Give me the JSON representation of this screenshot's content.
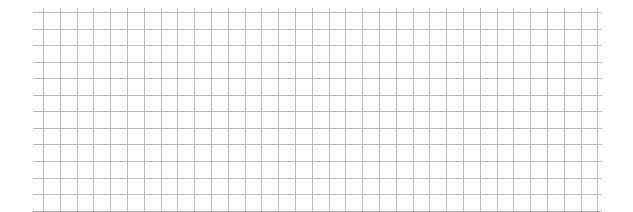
{
  "grid": {
    "background": "#ffffff",
    "line_color": "#b9b9b9",
    "h_lines": {
      "x_start": 33,
      "x_end": 602,
      "y_start": 12,
      "count": 13,
      "spacing": 16.55
    },
    "v_lines": {
      "x_start": 43,
      "count": 34,
      "spacing": 16.8,
      "y_start": 8,
      "y_end": 211
    }
  }
}
